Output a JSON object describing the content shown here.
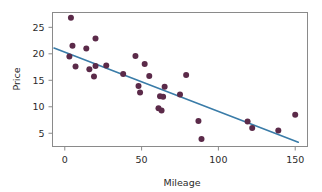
{
  "chart_data": {
    "type": "scatter",
    "title": "",
    "subtitle": "",
    "xlabel": "Mileage",
    "ylabel": "Price",
    "xlim": [
      -8,
      158
    ],
    "ylim": [
      2.5,
      27.8
    ],
    "xticks": [
      0,
      50,
      100,
      150
    ],
    "yticks": [
      5,
      10,
      15,
      20,
      25
    ],
    "xticklabels": [
      "0",
      "50",
      "100",
      "150"
    ],
    "yticklabels": [
      "5",
      "10",
      "15",
      "20",
      "25"
    ],
    "grid": false,
    "legend": null,
    "legend_position": "none",
    "point_color": "#5b2a49",
    "point_size": 3.0,
    "line_color": "#3a7ca8",
    "line_width": 1.6,
    "frame_color": "#8a8a8a",
    "background": "#ffffff",
    "series": [
      {
        "name": "observations",
        "type": "scatter",
        "points": [
          {
            "x": 4,
            "y": 26.8
          },
          {
            "x": 5,
            "y": 21.5
          },
          {
            "x": 3,
            "y": 19.5
          },
          {
            "x": 20,
            "y": 22.9
          },
          {
            "x": 14,
            "y": 21.0
          },
          {
            "x": 7,
            "y": 17.6
          },
          {
            "x": 16,
            "y": 17.1
          },
          {
            "x": 20,
            "y": 17.7
          },
          {
            "x": 19,
            "y": 15.7
          },
          {
            "x": 27,
            "y": 17.8
          },
          {
            "x": 38,
            "y": 16.2
          },
          {
            "x": 46,
            "y": 19.6
          },
          {
            "x": 52,
            "y": 18.1
          },
          {
            "x": 55,
            "y": 15.8
          },
          {
            "x": 48,
            "y": 13.9
          },
          {
            "x": 49,
            "y": 12.7
          },
          {
            "x": 62,
            "y": 12.0
          },
          {
            "x": 64,
            "y": 11.9
          },
          {
            "x": 65,
            "y": 13.8
          },
          {
            "x": 61,
            "y": 9.7
          },
          {
            "x": 63,
            "y": 9.3
          },
          {
            "x": 75,
            "y": 12.3
          },
          {
            "x": 79,
            "y": 16.0
          },
          {
            "x": 87,
            "y": 7.3
          },
          {
            "x": 89,
            "y": 3.9
          },
          {
            "x": 119,
            "y": 7.2
          },
          {
            "x": 122,
            "y": 6.0
          },
          {
            "x": 139,
            "y": 5.5
          },
          {
            "x": 150,
            "y": 8.5
          }
        ]
      },
      {
        "name": "regression-line",
        "type": "line",
        "endpoints": [
          {
            "x": -7,
            "y": 21.1
          },
          {
            "x": 152,
            "y": 3.3
          }
        ],
        "intercept": 20.3,
        "slope": -0.112
      }
    ]
  }
}
